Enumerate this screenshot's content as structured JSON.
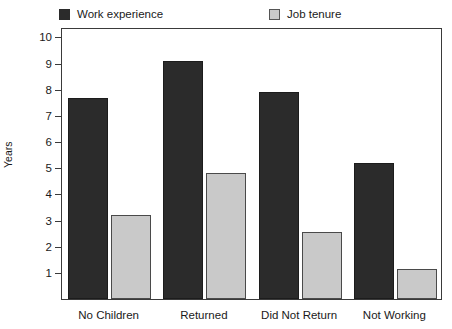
{
  "chart_data": {
    "type": "bar",
    "title": "",
    "xlabel": "",
    "ylabel": "Years",
    "categories": [
      "No Children",
      "Returned",
      "Did Not Return",
      "Not Working"
    ],
    "series": [
      {
        "name": "Work experience",
        "color": "#2b2b2b",
        "values": [
          7.7,
          9.1,
          7.9,
          5.2
        ]
      },
      {
        "name": "Job tenure",
        "color": "#c9c9c9",
        "values": [
          3.2,
          4.8,
          2.55,
          1.15
        ]
      }
    ],
    "ylim": [
      0,
      10.4
    ],
    "yticks": [
      10,
      9,
      8,
      7,
      6,
      5,
      4,
      3,
      2,
      1
    ],
    "ytick_labels": [
      "10",
      "9",
      "8",
      "7",
      "6",
      "5",
      "4",
      "3",
      "2",
      "1"
    ],
    "grid": false,
    "legend_position": "top",
    "frame": true
  }
}
